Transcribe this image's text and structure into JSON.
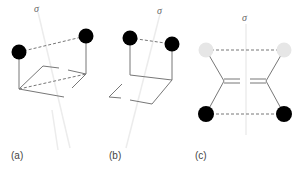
{
  "figure": {
    "panels": [
      {
        "id": "a",
        "label": "(a)",
        "symmetry_label": "σ",
        "atoms": [
          {
            "role": "left",
            "color": "#000000"
          },
          {
            "role": "right",
            "color": "#000000"
          }
        ]
      },
      {
        "id": "b",
        "label": "(b)",
        "symmetry_label": "σ",
        "atoms": [
          {
            "role": "left",
            "color": "#000000"
          },
          {
            "role": "right",
            "color": "#000000"
          }
        ]
      },
      {
        "id": "c",
        "label": "(c)",
        "symmetry_label": "σ",
        "atoms": [
          {
            "role": "top-left",
            "color": "#e6e6e6"
          },
          {
            "role": "top-right",
            "color": "#e6e6e6"
          },
          {
            "role": "bottom-left",
            "color": "#000000"
          },
          {
            "role": "bottom-right",
            "color": "#000000"
          }
        ]
      }
    ],
    "colors": {
      "bond": "#777777",
      "mirror_plane": "#ececec",
      "label": "#444444"
    }
  }
}
